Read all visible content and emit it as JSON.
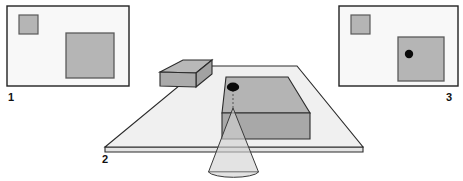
{
  "figure": {
    "background_color": "#ffffff",
    "panels": [
      {
        "id": "panel-1",
        "label": "1",
        "label_position": "bottom-left",
        "caption": "Reference image: small square upper-left, large square lower-right",
        "frame": {
          "x": 7,
          "y": 6,
          "width": 122,
          "height": 80
        },
        "fill": "#f8f8f8",
        "stroke": "#222222",
        "shapes": [
          {
            "name": "small-square",
            "x": 19,
            "y": 15,
            "width": 19,
            "height": 19,
            "fill": "#b5b5b5",
            "stroke": "#5a5a5a"
          },
          {
            "name": "large-square",
            "x": 66,
            "y": 33,
            "width": 48,
            "height": 45,
            "fill": "#b5b5b5",
            "stroke": "#5a5a5a"
          }
        ],
        "marker": null
      },
      {
        "id": "panel-3",
        "label": "3",
        "label_position": "bottom-right",
        "caption": "Projected-dot image: same squares with black dot inside the large square",
        "frame": {
          "x": 339,
          "y": 6,
          "width": 119,
          "height": 80
        },
        "fill": "#f8f8f8",
        "stroke": "#222222",
        "shapes": [
          {
            "name": "small-square",
            "x": 351,
            "y": 15,
            "width": 19,
            "height": 19,
            "fill": "#b5b5b5",
            "stroke": "#5a5a5a"
          },
          {
            "name": "large-square",
            "x": 398,
            "y": 37,
            "width": 46,
            "height": 44,
            "fill": "#b5b5b5",
            "stroke": "#5a5a5a"
          }
        ],
        "marker": {
          "name": "projected-dot",
          "cx": 409,
          "cy": 54,
          "rx": 4.2,
          "ry": 4.2,
          "fill": "#0a0a0a"
        }
      }
    ],
    "scene": {
      "id": "panel-2",
      "label": "2",
      "label_position": "bottom-left-of-table",
      "caption": "Perspective view of table with two boxes and projector cone",
      "table": {
        "name": "table-surface",
        "top_fill": "#f0f0f0",
        "edge_fill": "#e4e4e4",
        "stroke": "#2b2b2b",
        "top_polygon": "203,66 297,66 363,147 105,147",
        "front_edge_polygon": "105,147 363,147 363,152 105,152"
      },
      "boxes": [
        {
          "name": "small-box",
          "top_fill": "#b8b8b8",
          "front_fill": "#ababab",
          "side_fill": "#a2a2a2",
          "stroke": "#2b2b2b",
          "top_polygon": "160,72 183,60 212,60 196,73",
          "front_polygon": "160,72 196,73 196,86 160,86",
          "side_polygon": "196,73 212,60 212,73 196,86"
        },
        {
          "name": "large-box",
          "top_fill": "#b4b4b4",
          "front_fill": "#a8a8a8",
          "side_fill": "#9f9f9f",
          "stroke": "#2b2b2b",
          "top_polygon": "226,77 288,77 310,113 222,113",
          "front_polygon": "222,113 310,113 310,139 222,139",
          "side_polygon": "310,113 310,139 310,139 310,113"
        }
      ],
      "projection": {
        "name": "projector-cone",
        "fill": "#d2d2d2",
        "opacity": 0.62,
        "stroke": "#3a3a3a",
        "apex": {
          "x": 233,
          "y": 108
        },
        "cone_polygon": "233,108 208,172 259,172",
        "base_ellipse": {
          "cx": 233.5,
          "cy": 172,
          "rx": 25.5,
          "ry": 6.5
        }
      },
      "dot": {
        "name": "scene-dot",
        "cx": 233,
        "cy": 87,
        "rx": 6.2,
        "ry": 4.4,
        "fill": "#0a0a0a"
      },
      "dashed_ray": {
        "name": "dot-to-apex-ray",
        "x1": 233,
        "y1": 90,
        "x2": 233,
        "y2": 108,
        "stroke": "#555555",
        "dash": "2,2"
      }
    },
    "labels": [
      {
        "name": "label-1",
        "text": "1",
        "x": 11,
        "y": 101
      },
      {
        "name": "label-2",
        "text": "2",
        "x": 105,
        "y": 163
      },
      {
        "name": "label-3",
        "text": "3",
        "x": 449,
        "y": 101
      }
    ],
    "colors": {
      "ink": "#111111",
      "outline": "#2b2b2b",
      "panel_fill": "#f8f8f8",
      "square_fill": "#b5b5b5",
      "square_stroke": "#5a5a5a",
      "table_top": "#f0f0f0",
      "box_top": "#b4b4b4",
      "box_front": "#a8a8a8",
      "cone_fill": "#d2d2d2",
      "dot": "#0a0a0a"
    }
  }
}
